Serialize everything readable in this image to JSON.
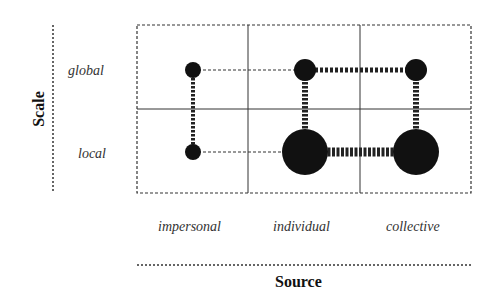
{
  "diagram": {
    "y_axis": {
      "title": "Scale",
      "rows": [
        {
          "label": "global"
        },
        {
          "label": "local"
        }
      ]
    },
    "x_axis": {
      "title": "Source",
      "columns": [
        {
          "label": "impersonal"
        },
        {
          "label": "individual"
        },
        {
          "label": "collective"
        }
      ]
    },
    "nodes": [
      {
        "column": "impersonal",
        "row": "global",
        "size": "small"
      },
      {
        "column": "impersonal",
        "row": "local",
        "size": "small"
      },
      {
        "column": "individual",
        "row": "global",
        "size": "medium"
      },
      {
        "column": "individual",
        "row": "local",
        "size": "large"
      },
      {
        "column": "collective",
        "row": "global",
        "size": "medium"
      },
      {
        "column": "collective",
        "row": "local",
        "size": "large"
      }
    ],
    "colors": {
      "node": "#111111",
      "line": "#333333",
      "text": "#333333"
    }
  }
}
